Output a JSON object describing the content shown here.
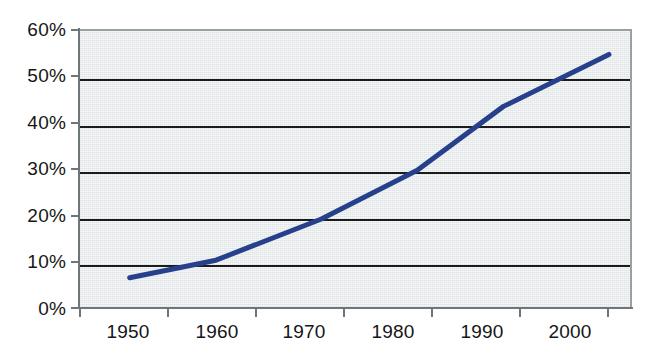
{
  "chart_data": {
    "type": "line",
    "title": "",
    "subtitle": "",
    "xlabel": "",
    "ylabel": "",
    "x": [
      1950,
      1960,
      1970,
      1980,
      1990,
      2000
    ],
    "categories": [
      "1950",
      "1960",
      "1970",
      "1980",
      "1990",
      "2000"
    ],
    "series": [
      {
        "name": "",
        "values": [
          6.3,
          10.2,
          19.0,
          29.5,
          43.3,
          54.5
        ],
        "color": "#27408b"
      }
    ],
    "points": [
      {
        "x": 1950,
        "y": 6.3
      },
      {
        "x": 1959,
        "y": 10.1
      },
      {
        "x": 1970,
        "y": 19.0
      },
      {
        "x": 1980,
        "y": 29.5
      },
      {
        "x": 1989,
        "y": 43.3
      },
      {
        "x": 2000,
        "y": 54.5
      }
    ],
    "ylim": [
      0,
      60
    ],
    "ytick_values": [
      0,
      10,
      20,
      30,
      40,
      50,
      60
    ],
    "ytick_labels": [
      "0%",
      "10%",
      "20%",
      "30%",
      "40%",
      "50%",
      "60%"
    ],
    "xtick_labels": [
      "1950",
      "1960",
      "1970",
      "1980",
      "1990",
      "2000"
    ],
    "grid": "horizontal",
    "legend": "none",
    "plot_background": "#dfe3e4",
    "gridline_color": "#1b1b1b",
    "axis_color": "#6f7679",
    "line_color": "#27408b",
    "line_width": 5
  },
  "axis": {
    "y_labels": [
      "60%",
      "50%",
      "40%",
      "30%",
      "20%",
      "10%",
      "0%"
    ],
    "x_labels": [
      "1950",
      "1960",
      "1970",
      "1980",
      "1990",
      "2000"
    ]
  }
}
